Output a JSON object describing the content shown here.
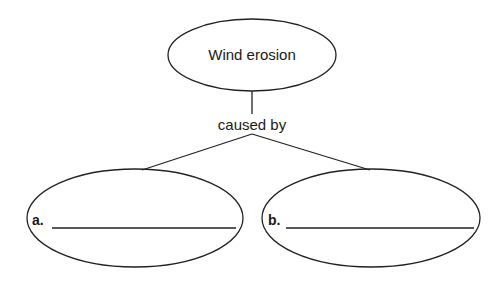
{
  "diagram": {
    "top_node": {
      "text": "Wind erosion"
    },
    "connector_label": "caused by",
    "children": [
      {
        "label": "a.",
        "answer": ""
      },
      {
        "label": "b.",
        "answer": ""
      }
    ]
  }
}
